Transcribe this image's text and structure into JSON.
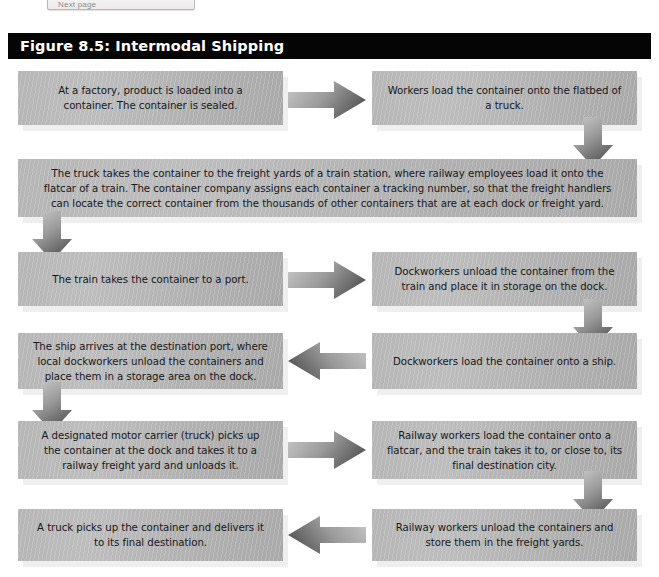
{
  "top_chrome": {
    "ghost_label": "Next page"
  },
  "figure": {
    "title": "Figure 8.5: Intermodal Shipping",
    "title_bar_color": "#050505",
    "node_fill_color": "#b4b4b4",
    "node_shadow_color": "#f0efef",
    "arrow_color": "#7a7a7a",
    "text_color": "#18181a"
  },
  "nodes": [
    {
      "id": "n1",
      "label": "At a factory, product is loaded into a container. The container is sealed."
    },
    {
      "id": "n2",
      "label": "Workers load the container onto the flatbed of a truck."
    },
    {
      "id": "n3",
      "label": "The truck takes the container to the freight yards of a train station, where railway employees load it onto the flatcar of a train. The container company assigns each container a tracking number, so that the freight handlers can locate the correct container from the thousands of other containers that are at each dock or freight yard."
    },
    {
      "id": "n4",
      "label": "The train takes the container to a port."
    },
    {
      "id": "n5",
      "label": "Dockworkers unload the container from the train and place it in storage on the dock."
    },
    {
      "id": "n6",
      "label": "The ship arrives at the destination port, where local dockworkers unload the containers and place them in a storage area on the dock."
    },
    {
      "id": "n7",
      "label": "Dockworkers load the container onto a ship."
    },
    {
      "id": "n8",
      "label": "A designated motor carrier (truck) picks up the container at the dock and takes it to a railway freight yard and unloads it."
    },
    {
      "id": "n9",
      "label": "Railway workers load the container onto a flatcar, and the train takes it to, or close to, its final destination city."
    },
    {
      "id": "n10",
      "label": "A truck picks up the container and delivers it to its final destination."
    },
    {
      "id": "n11",
      "label": "Railway workers unload the containers and store them in the freight yards."
    }
  ],
  "arrows": [
    {
      "id": "a1",
      "direction": "right",
      "from": "n1",
      "to": "n2"
    },
    {
      "id": "a2",
      "direction": "down",
      "from": "n2",
      "to": "n3"
    },
    {
      "id": "a3",
      "direction": "down",
      "from": "n3",
      "to": "n4"
    },
    {
      "id": "a4",
      "direction": "right",
      "from": "n4",
      "to": "n5"
    },
    {
      "id": "a5",
      "direction": "down",
      "from": "n5",
      "to": "n7"
    },
    {
      "id": "a6",
      "direction": "left",
      "from": "n7",
      "to": "n6"
    },
    {
      "id": "a7",
      "direction": "down",
      "from": "n6",
      "to": "n8"
    },
    {
      "id": "a8",
      "direction": "right",
      "from": "n8",
      "to": "n9"
    },
    {
      "id": "a9",
      "direction": "down",
      "from": "n9",
      "to": "n11"
    },
    {
      "id": "a10",
      "direction": "left",
      "from": "n11",
      "to": "n10"
    }
  ]
}
